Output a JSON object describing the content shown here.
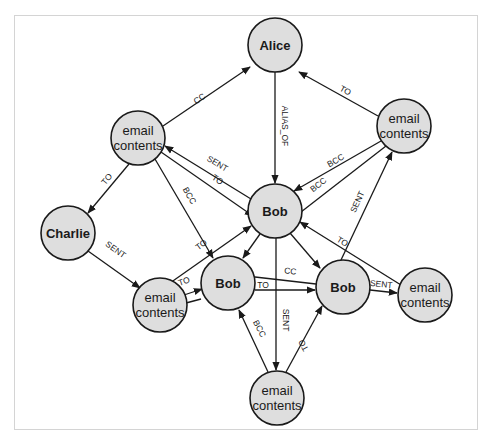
{
  "diagram": {
    "type": "graph",
    "nodes": [
      {
        "id": "alice",
        "label": "Alice",
        "lines": [
          "Alice"
        ],
        "x": 275,
        "y": 45,
        "r": 27
      },
      {
        "id": "email_ul",
        "label": "email contents",
        "lines": [
          "email",
          "contents"
        ],
        "x": 138,
        "y": 138,
        "r": 27
      },
      {
        "id": "email_ur",
        "label": "email contents",
        "lines": [
          "email",
          "contents"
        ],
        "x": 404,
        "y": 126,
        "r": 27
      },
      {
        "id": "bob_center",
        "label": "Bob",
        "lines": [
          "Bob"
        ],
        "x": 275,
        "y": 211,
        "r": 27
      },
      {
        "id": "charlie",
        "label": "Charlie",
        "lines": [
          "Charlie"
        ],
        "x": 68,
        "y": 233,
        "r": 27
      },
      {
        "id": "email_lm",
        "label": "email contents",
        "lines": [
          "email",
          "contents"
        ],
        "x": 160,
        "y": 305,
        "r": 27
      },
      {
        "id": "bob_left",
        "label": "Bob",
        "lines": [
          "Bob"
        ],
        "x": 228,
        "y": 283,
        "r": 27
      },
      {
        "id": "bob_right",
        "label": "Bob",
        "lines": [
          "Bob"
        ],
        "x": 343,
        "y": 287,
        "r": 27
      },
      {
        "id": "email_r",
        "label": "email contents",
        "lines": [
          "email",
          "contents"
        ],
        "x": 425,
        "y": 295,
        "r": 27
      },
      {
        "id": "email_b",
        "label": "email contents",
        "lines": [
          "email",
          "contents"
        ],
        "x": 277,
        "y": 398,
        "r": 27
      }
    ],
    "edges": [
      {
        "from": "email_ul",
        "to": "alice",
        "label": "CC"
      },
      {
        "from": "email_ur",
        "to": "alice",
        "label": "TO"
      },
      {
        "from": "alice",
        "to": "bob_center",
        "label": "ALIAS_OF"
      },
      {
        "from": "email_ul",
        "to": "charlie",
        "label": "TO"
      },
      {
        "from": "bob_center",
        "to": "email_ul",
        "label": "SENT"
      },
      {
        "from": "email_ul",
        "to": "bob_center",
        "label": "TO"
      },
      {
        "from": "email_ul",
        "to": "bob_left",
        "label": "BCC"
      },
      {
        "from": "email_ur",
        "to": "bob_center",
        "label": "BCC"
      },
      {
        "from": "email_ur",
        "to": "bob_center",
        "label": "BCC"
      },
      {
        "from": "charlie",
        "to": "email_lm",
        "label": "SENT"
      },
      {
        "from": "email_lm",
        "to": "bob_center",
        "label": "TO"
      },
      {
        "from": "email_lm",
        "to": "bob_left",
        "label": "TO"
      },
      {
        "from": "bob_center",
        "to": "bob_left",
        "label": ""
      },
      {
        "from": "bob_center",
        "to": "bob_right",
        "label": ""
      },
      {
        "from": "bob_left",
        "to": "bob_right",
        "label": "CC"
      },
      {
        "from": "bob_left",
        "to": "bob_right",
        "label": "TO"
      },
      {
        "from": "bob_center",
        "to": "email_b",
        "label": "SENT"
      },
      {
        "from": "email_b",
        "to": "bob_left",
        "label": "BCC"
      },
      {
        "from": "email_b",
        "to": "bob_right",
        "label": "TO"
      },
      {
        "from": "bob_right",
        "to": "email_ur",
        "label": "SENT"
      },
      {
        "from": "email_r",
        "to": "bob_center",
        "label": "TO"
      },
      {
        "from": "bob_right",
        "to": "email_r",
        "label": "SENT"
      }
    ]
  },
  "labels": {
    "alice": "Alice",
    "bob": "Bob",
    "charlie": "Charlie",
    "email_line1": "email",
    "email_line2": "contents",
    "cc": "CC",
    "to": "TO",
    "bcc": "BCC",
    "sent": "SENT",
    "alias_of": "ALIAS_OF"
  },
  "colors": {
    "node_fill": "#dedede",
    "node_stroke": "#1a1a1a",
    "edge": "#1a1a1a",
    "frame": "#d4d4d4",
    "background": "#ffffff"
  }
}
